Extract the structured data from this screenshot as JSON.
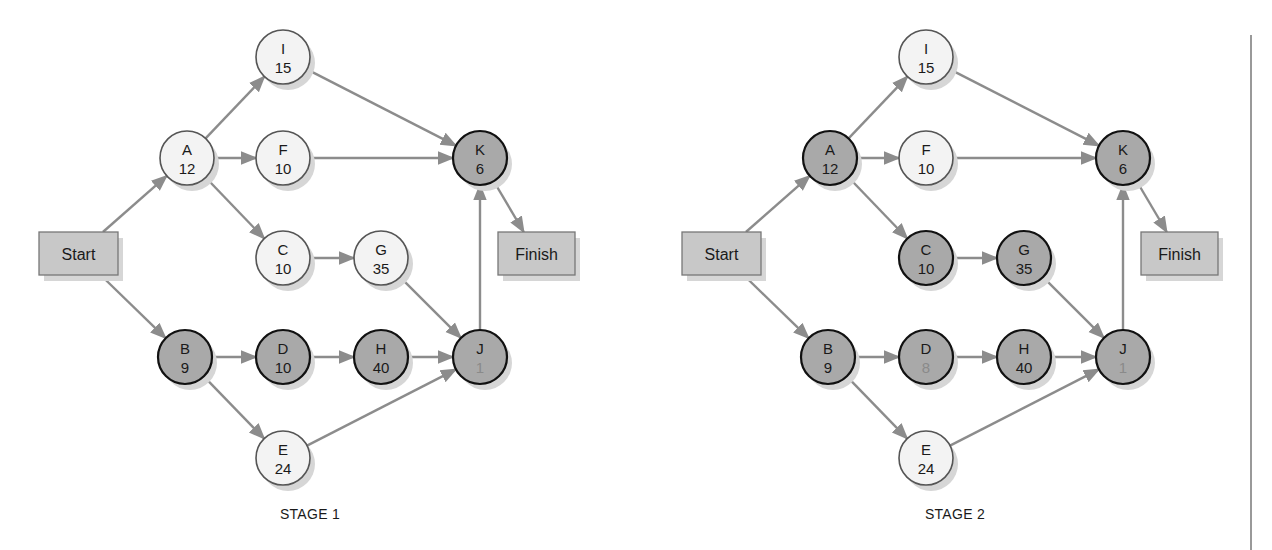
{
  "diagram": {
    "colors": {
      "critical_fill": "#a9a9a9",
      "critical_stroke": "#111111",
      "normal_fill": "#f3f3f3",
      "normal_stroke": "#555555",
      "box_fill": "#c8c8c8",
      "box_stroke": "#777777",
      "edge": "#8c8c8c",
      "shadow": "#d6d6d6",
      "divider": "#777777"
    },
    "node_radius": 27,
    "terminals": {
      "start_label": "Start",
      "finish_label": "Finish"
    },
    "edges": [
      [
        "Start",
        "A"
      ],
      [
        "Start",
        "B"
      ],
      [
        "A",
        "I"
      ],
      [
        "A",
        "F"
      ],
      [
        "A",
        "C"
      ],
      [
        "I",
        "K"
      ],
      [
        "F",
        "K"
      ],
      [
        "C",
        "G"
      ],
      [
        "G",
        "J"
      ],
      [
        "B",
        "D"
      ],
      [
        "B",
        "E"
      ],
      [
        "D",
        "H"
      ],
      [
        "H",
        "J"
      ],
      [
        "E",
        "J"
      ],
      [
        "J",
        "K"
      ],
      [
        "K",
        "Finish"
      ]
    ],
    "stages": [
      {
        "label": "STAGE 1",
        "offset_x": 0,
        "nodes": [
          {
            "id": "I",
            "value": "15",
            "x": 283,
            "y": 57,
            "critical": false
          },
          {
            "id": "A",
            "value": "12",
            "x": 187,
            "y": 158,
            "critical": false
          },
          {
            "id": "F",
            "value": "10",
            "x": 283,
            "y": 158,
            "critical": false
          },
          {
            "id": "K",
            "value": "6",
            "x": 480,
            "y": 158,
            "critical": true
          },
          {
            "id": "C",
            "value": "10",
            "x": 283,
            "y": 258,
            "critical": false
          },
          {
            "id": "G",
            "value": "35",
            "x": 381,
            "y": 258,
            "critical": false
          },
          {
            "id": "B",
            "value": "9",
            "x": 185,
            "y": 357,
            "critical": true
          },
          {
            "id": "D",
            "value": "10",
            "x": 283,
            "y": 357,
            "critical": true
          },
          {
            "id": "H",
            "value": "40",
            "x": 381,
            "y": 357,
            "critical": true
          },
          {
            "id": "J",
            "value": "1",
            "x": 480,
            "y": 357,
            "critical": true,
            "faint_value": true
          },
          {
            "id": "E",
            "value": "24",
            "x": 283,
            "y": 458,
            "critical": false
          }
        ],
        "start_box": {
          "x": 39,
          "y": 232,
          "w": 79,
          "h": 43
        },
        "finish_box": {
          "x": 498,
          "y": 232,
          "w": 77,
          "h": 43
        },
        "label_pos": {
          "x": 310,
          "y": 519
        }
      },
      {
        "label": "STAGE 2",
        "offset_x": 643,
        "nodes": [
          {
            "id": "I",
            "value": "15",
            "x": 283,
            "y": 57,
            "critical": false
          },
          {
            "id": "A",
            "value": "12",
            "x": 187,
            "y": 158,
            "critical": true
          },
          {
            "id": "F",
            "value": "10",
            "x": 283,
            "y": 158,
            "critical": false
          },
          {
            "id": "K",
            "value": "6",
            "x": 480,
            "y": 158,
            "critical": true
          },
          {
            "id": "C",
            "value": "10",
            "x": 283,
            "y": 258,
            "critical": true
          },
          {
            "id": "G",
            "value": "35",
            "x": 381,
            "y": 258,
            "critical": true
          },
          {
            "id": "B",
            "value": "9",
            "x": 185,
            "y": 357,
            "critical": true
          },
          {
            "id": "D",
            "value": "8",
            "x": 283,
            "y": 357,
            "critical": true,
            "faint_value": true
          },
          {
            "id": "H",
            "value": "40",
            "x": 381,
            "y": 357,
            "critical": true
          },
          {
            "id": "J",
            "value": "1",
            "x": 480,
            "y": 357,
            "critical": true,
            "faint_value": true
          },
          {
            "id": "E",
            "value": "24",
            "x": 283,
            "y": 458,
            "critical": false
          }
        ],
        "start_box": {
          "x": 39,
          "y": 232,
          "w": 79,
          "h": 43
        },
        "finish_box": {
          "x": 498,
          "y": 232,
          "w": 77,
          "h": 43
        },
        "label_pos": {
          "x": 312,
          "y": 519
        }
      }
    ],
    "divider": {
      "x": 1251,
      "y1": 35,
      "y2": 550
    }
  }
}
